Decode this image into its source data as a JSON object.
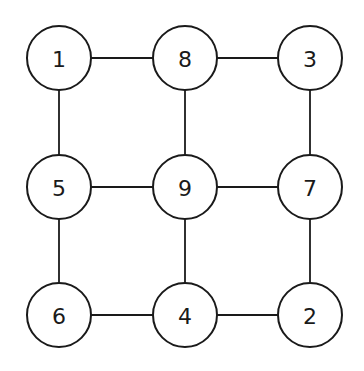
{
  "diagram": {
    "type": "grid-graph",
    "rows": 3,
    "cols": 3,
    "nodes": [
      {
        "id": "n1",
        "label": "1",
        "row": 0,
        "col": 0,
        "x": 59,
        "y": 58
      },
      {
        "id": "n8",
        "label": "8",
        "row": 0,
        "col": 1,
        "x": 185,
        "y": 58
      },
      {
        "id": "n3",
        "label": "3",
        "row": 0,
        "col": 2,
        "x": 310,
        "y": 58
      },
      {
        "id": "n5",
        "label": "5",
        "row": 1,
        "col": 0,
        "x": 59,
        "y": 187
      },
      {
        "id": "n9",
        "label": "9",
        "row": 1,
        "col": 1,
        "x": 185,
        "y": 187
      },
      {
        "id": "n7",
        "label": "7",
        "row": 1,
        "col": 2,
        "x": 310,
        "y": 187
      },
      {
        "id": "n6",
        "label": "6",
        "row": 2,
        "col": 0,
        "x": 59,
        "y": 315
      },
      {
        "id": "n4",
        "label": "4",
        "row": 2,
        "col": 1,
        "x": 185,
        "y": 315
      },
      {
        "id": "n2",
        "label": "2",
        "row": 2,
        "col": 2,
        "x": 310,
        "y": 315
      }
    ],
    "edges": [
      [
        "1",
        "8"
      ],
      [
        "8",
        "3"
      ],
      [
        "5",
        "9"
      ],
      [
        "9",
        "7"
      ],
      [
        "6",
        "4"
      ],
      [
        "4",
        "2"
      ],
      [
        "1",
        "5"
      ],
      [
        "5",
        "6"
      ],
      [
        "8",
        "9"
      ],
      [
        "9",
        "4"
      ],
      [
        "3",
        "7"
      ],
      [
        "7",
        "2"
      ]
    ],
    "node_radius": 32,
    "colors": {
      "stroke": "#1a1a1a",
      "fill": "#ffffff",
      "background": "#ffffff"
    }
  }
}
